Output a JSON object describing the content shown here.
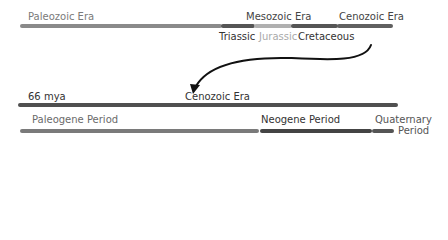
{
  "top_timeline": {
    "eras": [
      {
        "label": "Paleozoic Era",
        "color": "#8a8a8a",
        "text_color": "#7a7a7a"
      },
      {
        "label": "Mesozoic Era",
        "color": "#555555",
        "text_color": "#444444"
      },
      {
        "label": "Cenozoic Era",
        "color": "#606060",
        "text_color": "#444444"
      }
    ],
    "mesozoic_periods": [
      {
        "label": "Triassic",
        "color": "#555555",
        "text_color": "#333333"
      },
      {
        "label": "Jurassic",
        "color": "#b0b0b0",
        "text_color": "#aaaaaa"
      },
      {
        "label": "Cretaceous",
        "color": "#555555",
        "text_color": "#333333"
      }
    ]
  },
  "zoom_timeline": {
    "start_label": "66 mya",
    "era_label": "Cenozoic Era",
    "era_color": "#505050",
    "periods": [
      {
        "label": "Paleogene Period",
        "color": "#7a7a7a",
        "text_color": "#6a6a6a"
      },
      {
        "label": "Neogene Period",
        "color": "#444444",
        "text_color": "#333333"
      },
      {
        "label": "Quaternary",
        "label2": "Period",
        "color": "#555555",
        "text_color": "#555555"
      }
    ]
  },
  "arrow": {
    "color": "#111111"
  }
}
